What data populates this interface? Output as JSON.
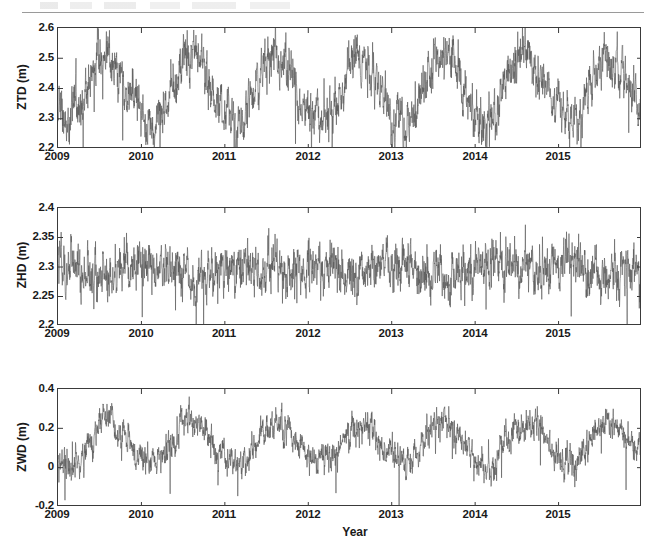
{
  "figure": {
    "kind": "multi-panel-time-series",
    "page_rule": "",
    "xlabel": "Year"
  },
  "chart_data": [
    {
      "type": "line",
      "panel": "top",
      "title": "",
      "ylabel": "ZTD (m)",
      "xlabel": "Year",
      "ylim": [
        2.2,
        2.6
      ],
      "yticks": [
        2.2,
        2.3,
        2.4,
        2.5,
        2.6
      ],
      "ytick_labels": [
        "2.2",
        "2.3",
        "2.4",
        "2.5",
        "2.6"
      ],
      "xlim": [
        2009.0,
        2016.0
      ],
      "xticks": [
        2009,
        2010,
        2011,
        2012,
        2013,
        2014,
        2015
      ],
      "xtick_labels": [
        "2009",
        "2010",
        "2011",
        "2012",
        "2013",
        "2014",
        "2015"
      ],
      "grid": false,
      "legend": "none",
      "series_name": "ZTD",
      "color": "#585858",
      "description": "Zenith Total Delay, strong annual seasonal cycle, summer maxima near 2.55-2.60 m and winter minima near 2.28-2.33 m, with dense sub-daily scatter.",
      "seasonal_mean": 2.4,
      "seasonal_amplitude": 0.105,
      "noise_sigma": 0.035,
      "annual_minima": [
        2.3,
        2.31,
        2.3,
        2.31,
        2.3,
        2.31,
        2.3
      ],
      "annual_maxima": [
        2.57,
        2.58,
        2.56,
        2.58,
        2.57,
        2.58,
        2.57
      ],
      "phase_peak_month": 7.4
    },
    {
      "type": "line",
      "panel": "middle",
      "title": "",
      "ylabel": "ZHD (m)",
      "xlabel": "Year",
      "ylim": [
        2.2,
        2.4
      ],
      "yticks": [
        2.2,
        2.25,
        2.3,
        2.35,
        2.4
      ],
      "ytick_labels": [
        "2.2",
        "2.25",
        "2.3",
        "2.35",
        "2.4"
      ],
      "xlim": [
        2009.0,
        2016.0
      ],
      "xticks": [
        2009,
        2010,
        2011,
        2012,
        2013,
        2014,
        2015
      ],
      "xtick_labels": [
        "2009",
        "2010",
        "2011",
        "2012",
        "2013",
        "2014",
        "2015"
      ],
      "grid": false,
      "legend": "none",
      "series_name": "ZHD",
      "color": "#585858",
      "description": "Zenith Hydrostatic Delay, nearly flat about 2.295 m with weather-driven scatter mostly between 2.25 and 2.35 m, no clear annual cycle.",
      "seasonal_mean": 2.296,
      "seasonal_amplitude": 0.006,
      "noise_sigma": 0.018,
      "annual_minima": [
        2.23,
        2.22,
        2.22,
        2.23,
        2.23,
        2.22,
        2.23
      ],
      "annual_maxima": [
        2.35,
        2.35,
        2.36,
        2.35,
        2.35,
        2.36,
        2.35
      ],
      "phase_peak_month": 1.0
    },
    {
      "type": "line",
      "panel": "bottom",
      "title": "",
      "ylabel": "ZWD (m)",
      "xlabel": "Year",
      "ylim": [
        -0.2,
        0.4
      ],
      "yticks": [
        -0.2,
        0,
        0.2,
        0.4
      ],
      "ytick_labels": [
        "-0.2",
        "0",
        "0.2",
        "0.4"
      ],
      "xlim": [
        2009.0,
        2016.0
      ],
      "xticks": [
        2009,
        2010,
        2011,
        2012,
        2013,
        2014,
        2015
      ],
      "xtick_labels": [
        "2009",
        "2010",
        "2011",
        "2012",
        "2013",
        "2014",
        "2015"
      ],
      "grid": false,
      "legend": "none",
      "series_name": "ZWD",
      "color": "#585858",
      "description": "Zenith Wet Delay, clear annual cycle with summer maxima near 0.30-0.33 m and winter minima near 0.02-0.05 m, occasional downward spikes to -0.1 m.",
      "seasonal_mean": 0.125,
      "seasonal_amplitude": 0.1,
      "noise_sigma": 0.035,
      "annual_minima": [
        0.0,
        0.0,
        -0.01,
        0.0,
        -0.01,
        0.0,
        0.0
      ],
      "annual_maxima": [
        0.32,
        0.33,
        0.32,
        0.33,
        0.32,
        0.33,
        0.33
      ],
      "phase_peak_month": 7.4
    }
  ],
  "panels": [
    {
      "name": "ztd-panel",
      "ylabel": "ZTD (m)",
      "ytick_labels": [
        "2.6",
        "2.5",
        "2.4",
        "2.3",
        "2.2"
      ],
      "xtick_labels": [
        "2009",
        "2010",
        "2011",
        "2012",
        "2013",
        "2014",
        "2015"
      ]
    },
    {
      "name": "zhd-panel",
      "ylabel": "ZHD (m)",
      "ytick_labels": [
        "2.4",
        "2.35",
        "2.3",
        "2.25",
        "2.2"
      ],
      "xtick_labels": [
        "2009",
        "2010",
        "2011",
        "2012",
        "2013",
        "2014",
        "2015"
      ]
    },
    {
      "name": "zwd-panel",
      "ylabel": "ZWD (m)",
      "ytick_labels": [
        "0.4",
        "0.2",
        "0",
        "-0.2"
      ],
      "xtick_labels": [
        "2009",
        "2010",
        "2011",
        "2012",
        "2013",
        "2014",
        "2015"
      ]
    }
  ]
}
